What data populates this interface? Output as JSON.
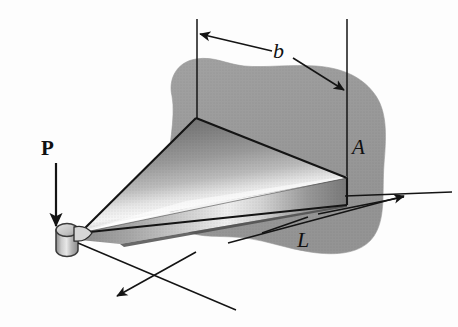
{
  "figure": {
    "kind": "engineering-diagram",
    "background_color": "#fdfdfd"
  },
  "labels": {
    "load": "P",
    "width": "b",
    "area": "A",
    "length": "L"
  },
  "colors": {
    "wall_gray": "#9a9a9a",
    "wall_gray_edge": "#a8a8a8",
    "plate_dark": "#6e6e6e",
    "plate_mid": "#8f8f8f",
    "plate_highlight": "#f2f2f2",
    "plate_edge_dark": "#5a5a5a",
    "outline": "#141414",
    "pin_light": "#d9d9d9",
    "pin_dark": "#7d7d7d"
  },
  "geometry": {
    "plate_apex_top": [
      196,
      118
    ],
    "plate_tip_left": [
      80,
      233
    ],
    "plate_right_top": [
      347,
      178
    ],
    "plate_right_bottom": [
      347,
      205
    ],
    "pin_center": [
      68,
      238
    ],
    "b_dimension_left_x": 197,
    "b_dimension_right_x": 347,
    "a_dimension_x": 347
  }
}
